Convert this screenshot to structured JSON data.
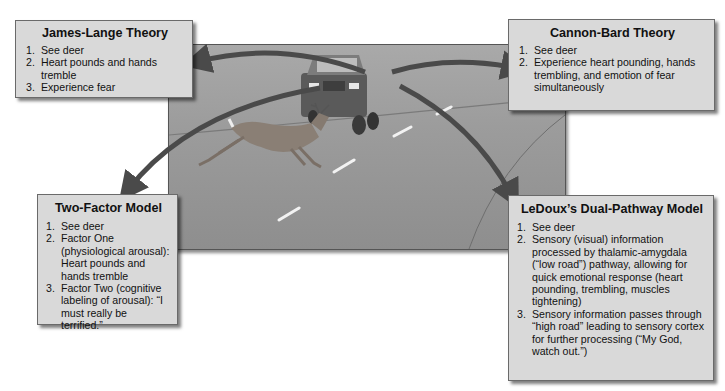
{
  "scene": {
    "description": "Deer leaping across a road in front of an oncoming pickup truck",
    "palette": {
      "road": "#9c9c9c",
      "box_fill": "#d9d9d9",
      "arrow": "#4a4a4a",
      "border": "#6a6a6a"
    }
  },
  "boxes": {
    "james_lange": {
      "title": "James-Lange Theory",
      "items": [
        {
          "num": "1.",
          "text": "See deer"
        },
        {
          "num": "2.",
          "text": "Heart pounds and hands tremble"
        },
        {
          "num": "3.",
          "text": "Experience fear"
        }
      ]
    },
    "cannon_bard": {
      "title": "Cannon-Bard Theory",
      "items": [
        {
          "num": "1.",
          "text": "See deer"
        },
        {
          "num": "2.",
          "text": "Experience heart pounding, hands trembling, and emotion of fear simultaneously"
        }
      ]
    },
    "two_factor": {
      "title": "Two-Factor Model",
      "items": [
        {
          "num": "1.",
          "text": "See deer"
        },
        {
          "num": "2.",
          "text": "Factor One (physiological arousal): Heart pounds and hands tremble"
        },
        {
          "num": "3.",
          "text": "Factor Two (cognitive labeling of arousal): “I must really be terrified.”"
        }
      ]
    },
    "ledoux": {
      "title": "LeDoux’s Dual-Pathway Model",
      "items": [
        {
          "num": "1.",
          "text": "See deer"
        },
        {
          "num": "2.",
          "text": "Sensory (visual) information processed by thalamic-amygdala (“low road”) pathway, allowing for quick emotional response (heart pounding, trembling, muscles tightening)"
        },
        {
          "num": "3.",
          "text": "Sensory information passes through “high road” leading to sensory cortex for further processing (“My God, watch out.”)"
        }
      ]
    }
  }
}
